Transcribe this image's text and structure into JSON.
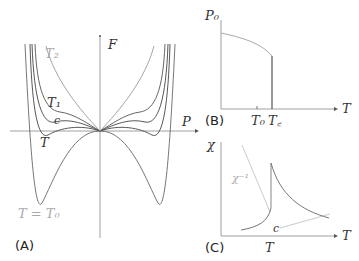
{
  "panels": {
    "A": {
      "label": "(A)",
      "y_axis": "F",
      "x_axis": "P",
      "curves": [
        {
          "name": "T2",
          "label": "T₂",
          "color": "#999999"
        },
        {
          "name": "T1",
          "label": "T₁",
          "color": "#444444"
        },
        {
          "name": "Tc",
          "label": "c",
          "color": "#444444"
        },
        {
          "name": "T",
          "label": "T",
          "color": "#444444"
        },
        {
          "name": "T0",
          "label": "T = T₀",
          "color": "#999999"
        }
      ]
    },
    "B": {
      "label": "(B)",
      "y_axis": "P₀",
      "x_axis": "T",
      "ticks": [
        "T₀",
        "T꜀"
      ]
    },
    "C": {
      "label": "(C)",
      "y_axis": "χ",
      "x_axis": "T",
      "inverse_label": "χ⁻¹",
      "point_label": "c",
      "tick": "T"
    }
  },
  "colors": {
    "axis": "#555555",
    "dark_curve": "#555555",
    "light_curve": "#b0b0b0"
  }
}
